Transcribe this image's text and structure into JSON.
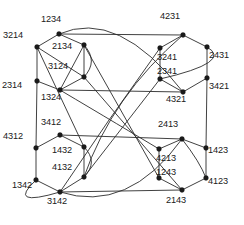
{
  "figure": {
    "name": "permutohedron-cayley-graph-s4",
    "background_color": "#ffffff",
    "edge_color": "#2b2b2b",
    "node_color": "#1a1a1a",
    "width": 244,
    "height": 225
  },
  "nodes": [
    {
      "id": "n1234",
      "label": "1234",
      "x": 59,
      "y": 34,
      "lx": 41,
      "ly": 15
    },
    {
      "id": "n3214",
      "label": "3214",
      "x": 37,
      "y": 47,
      "lx": 3,
      "ly": 31
    },
    {
      "id": "n2134",
      "label": "2134",
      "x": 84,
      "y": 45,
      "lx": 52,
      "ly": 42
    },
    {
      "id": "n3124",
      "label": "3124",
      "x": 84,
      "y": 77,
      "lx": 48,
      "ly": 62
    },
    {
      "id": "n2314",
      "label": "2314",
      "x": 37,
      "y": 81,
      "lx": 2,
      "ly": 81
    },
    {
      "id": "n1324",
      "label": "1324",
      "x": 60,
      "y": 90,
      "lx": 41,
      "ly": 93
    },
    {
      "id": "n4231",
      "label": "4231",
      "x": 183,
      "y": 35,
      "lx": 160,
      "ly": 12
    },
    {
      "id": "n3241",
      "label": "3241",
      "x": 160,
      "y": 48,
      "lx": 157,
      "ly": 53
    },
    {
      "id": "n2431",
      "label": "2431",
      "x": 207,
      "y": 47,
      "lx": 209,
      "ly": 51
    },
    {
      "id": "n2341",
      "label": "2341",
      "x": 160,
      "y": 79,
      "lx": 157,
      "ly": 67
    },
    {
      "id": "n3421",
      "label": "3421",
      "x": 207,
      "y": 78,
      "lx": 209,
      "ly": 82
    },
    {
      "id": "n4321",
      "label": "4321",
      "x": 183,
      "y": 92,
      "lx": 166,
      "ly": 95
    },
    {
      "id": "n3412",
      "label": "3412",
      "x": 60,
      "y": 135,
      "lx": 41,
      "ly": 118
    },
    {
      "id": "n4312",
      "label": "4312",
      "x": 36,
      "y": 148,
      "lx": 3,
      "ly": 132
    },
    {
      "id": "n1432",
      "label": "1432",
      "x": 84,
      "y": 147,
      "lx": 52,
      "ly": 146
    },
    {
      "id": "n4132",
      "label": "4132",
      "x": 84,
      "y": 177,
      "lx": 52,
      "ly": 163
    },
    {
      "id": "n1342",
      "label": "1342",
      "x": 36,
      "y": 180,
      "lx": 12,
      "ly": 181
    },
    {
      "id": "n3142",
      "label": "3142",
      "x": 60,
      "y": 192,
      "lx": 47,
      "ly": 197
    },
    {
      "id": "n2413",
      "label": "2413",
      "x": 182,
      "y": 139,
      "lx": 158,
      "ly": 120
    },
    {
      "id": "n4213",
      "label": "4213",
      "x": 159,
      "y": 149,
      "lx": 156,
      "ly": 154
    },
    {
      "id": "n1423",
      "label": "1423",
      "x": 206,
      "y": 148,
      "lx": 208,
      "ly": 146
    },
    {
      "id": "n1243",
      "label": "1243",
      "x": 159,
      "y": 178,
      "lx": 156,
      "ly": 168
    },
    {
      "id": "n4123",
      "label": "4123",
      "x": 206,
      "y": 178,
      "lx": 208,
      "ly": 177
    },
    {
      "id": "n2143",
      "label": "2143",
      "x": 182,
      "y": 190,
      "lx": 166,
      "ly": 196
    }
  ],
  "straight_edges": [
    [
      "n1234",
      "n3214"
    ],
    [
      "n1234",
      "n2134"
    ],
    [
      "n3214",
      "n2314"
    ],
    [
      "n3214",
      "n3124"
    ],
    [
      "n2134",
      "n3124"
    ],
    [
      "n2134",
      "n1324"
    ],
    [
      "n3124",
      "n1324"
    ],
    [
      "n2314",
      "n1324"
    ],
    [
      "n4231",
      "n3241"
    ],
    [
      "n4231",
      "n2431"
    ],
    [
      "n3241",
      "n2341"
    ],
    [
      "n2431",
      "n3421"
    ],
    [
      "n2341",
      "n4321"
    ],
    [
      "n3421",
      "n4321"
    ],
    [
      "n3412",
      "n4312"
    ],
    [
      "n3412",
      "n1432"
    ],
    [
      "n4312",
      "n1342"
    ],
    [
      "n1432",
      "n4132"
    ],
    [
      "n1342",
      "n3142"
    ],
    [
      "n4132",
      "n3142"
    ],
    [
      "n2413",
      "n4213"
    ],
    [
      "n2413",
      "n1423"
    ],
    [
      "n4213",
      "n1243"
    ],
    [
      "n1423",
      "n4123"
    ],
    [
      "n1243",
      "n2143"
    ],
    [
      "n4123",
      "n2143"
    ],
    [
      "n1234",
      "n4231"
    ],
    [
      "n1324",
      "n4321"
    ],
    [
      "n3412",
      "n2413"
    ],
    [
      "n3142",
      "n2143"
    ],
    [
      "n2314",
      "n4312"
    ],
    [
      "n3421",
      "n1423"
    ],
    [
      "n3214",
      "n1432"
    ],
    [
      "n2134",
      "n1243"
    ],
    [
      "n3124",
      "n2143"
    ],
    [
      "n2341",
      "n4132"
    ]
  ],
  "curved_edges": [
    {
      "from": "n1234",
      "to": "n4321",
      "cx": 118,
      "cy": 8,
      "name": "arc-1234-4321"
    },
    {
      "from": "n3241",
      "to": "n3142",
      "cx": 108,
      "cy": 120,
      "name": "arc-3241-3142"
    },
    {
      "from": "n4213",
      "to": "n1324",
      "cx": 124,
      "cy": 128,
      "name": "arc-4213-1324"
    },
    {
      "from": "n2431",
      "to": "n2341",
      "cx": 234,
      "cy": 62,
      "name": "arc-2431-2341"
    },
    {
      "from": "n1342",
      "to": "n3142",
      "cx": 6,
      "cy": 208,
      "name": "arc-1342-3142"
    },
    {
      "from": "n1432",
      "to": "n4132",
      "cx": 99,
      "cy": 162,
      "name": "arc-1432-4132"
    },
    {
      "from": "n2134",
      "to": "n3124",
      "cx": 99,
      "cy": 61,
      "name": "arc-2134-3124"
    },
    {
      "from": "n2413",
      "to": "n4123",
      "cx": 200,
      "cy": 162,
      "name": "arc-2413-4123"
    },
    {
      "from": "n3142",
      "to": "n2413",
      "cx": 128,
      "cy": 214,
      "name": "arc-3142-2413"
    },
    {
      "from": "n4132",
      "to": "n4231",
      "cx": 112,
      "cy": 96,
      "name": "arc-4132-4231"
    }
  ]
}
